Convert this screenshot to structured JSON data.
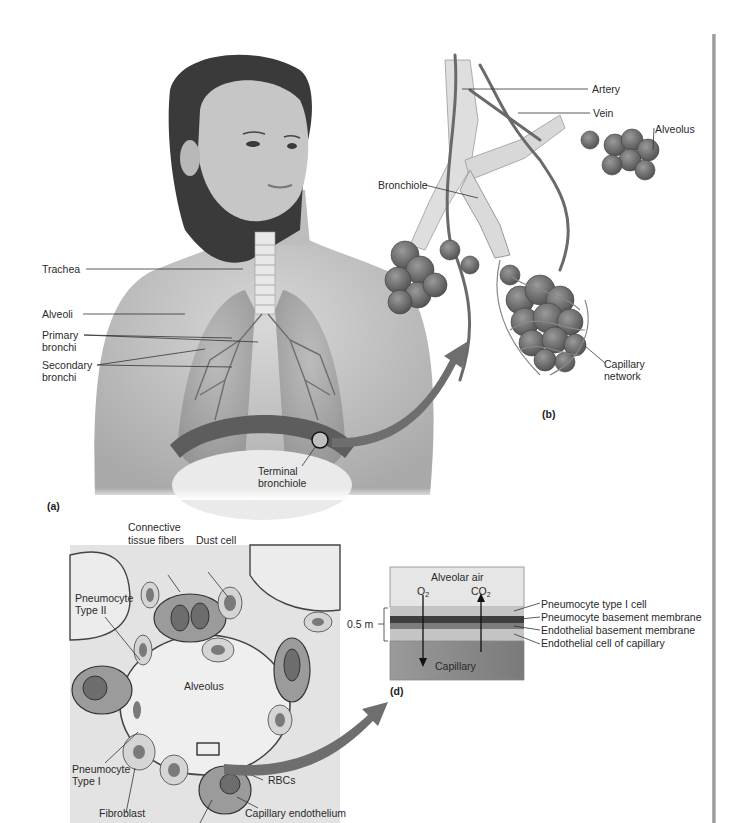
{
  "figure": {
    "panels": {
      "a": {
        "tag": "(a)",
        "labels": {
          "trachea": "Trachea",
          "alveoli": "Alveoli",
          "primary_bronchi_1": "Primary",
          "primary_bronchi_2": "bronchi",
          "secondary_bronchi_1": "Secondary",
          "secondary_bronchi_2": "bronchi",
          "terminal_bronchiole_1": "Terminal",
          "terminal_bronchiole_2": "bronchiole"
        }
      },
      "b": {
        "tag": "(b)",
        "labels": {
          "artery": "Artery",
          "vein": "Vein",
          "alveolus": "Alveolus",
          "bronchiole": "Bronchiole",
          "capillary_network_1": "Capillary",
          "capillary_network_2": "network"
        }
      },
      "c": {
        "labels": {
          "connective_1": "Connective",
          "connective_2": "tissue fibers",
          "dust_cell": "Dust cell",
          "pneumocyte_ii_1": "Pneumocyte",
          "pneumocyte_ii_2": "Type II",
          "alveolus": "Alveolus",
          "pneumocyte_i_1": "Pneumocyte",
          "pneumocyte_i_2": "Type I",
          "rbcs": "RBCs",
          "fibroblast": "Fibroblast",
          "capillary_endothelium": "Capillary endothelium"
        }
      },
      "d": {
        "tag": "(d)",
        "labels": {
          "alveolar_air": "Alveolar air",
          "o2": "O",
          "co2": "CO",
          "sub2": "2",
          "capillary": "Capillary",
          "thickness": "0.5 m",
          "layer_1": "Pneumocyte type I cell",
          "layer_2": "Pneumocyte basement membrane",
          "layer_3": "Endothelial basement membrane",
          "layer_4": "Endothelial cell of capillary"
        }
      }
    }
  }
}
